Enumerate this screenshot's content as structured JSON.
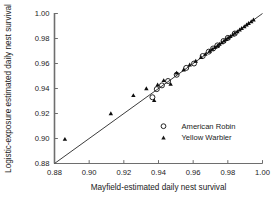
{
  "chart_data": {
    "type": "scatter",
    "title": "",
    "xlabel": "Mayfield-estimated daily nest survival",
    "ylabel": "Logistic-exposure estimated daily nest survival",
    "xlim": [
      0.88,
      1.0
    ],
    "ylim": [
      0.88,
      1.0
    ],
    "xticks": [
      "0.88",
      "0.90",
      "0.92",
      "0.94",
      "0.96",
      "0.98",
      "1.00"
    ],
    "yticks": [
      "0.88",
      "0.90",
      "0.92",
      "0.94",
      "0.96",
      "0.98",
      "1.00"
    ],
    "xtick_values": [
      0.88,
      0.9,
      0.92,
      0.94,
      0.96,
      0.98,
      1.0
    ],
    "ytick_values": [
      0.88,
      0.9,
      0.92,
      0.94,
      0.96,
      0.98,
      1.0
    ],
    "grid": false,
    "legend_position": "inside-lower-right",
    "reference_line": {
      "label": "1:1 line",
      "from": [
        0.88,
        0.88
      ],
      "to": [
        1.0,
        1.0
      ],
      "color": "#3c3c3c"
    },
    "series": [
      {
        "name": "American Robin",
        "marker": "open-circle",
        "color": "#1a1a1a",
        "points": [
          [
            0.9365,
            0.933
          ],
          [
            0.939,
            0.9395
          ],
          [
            0.942,
            0.9425
          ],
          [
            0.9455,
            0.946
          ],
          [
            0.9505,
            0.951
          ],
          [
            0.956,
            0.9565
          ],
          [
            0.9605,
            0.96
          ],
          [
            0.9655,
            0.966
          ],
          [
            0.969,
            0.9695
          ],
          [
            0.9715,
            0.972
          ],
          [
            0.974,
            0.9745
          ],
          [
            0.9775,
            0.978
          ],
          [
            0.98,
            0.9805
          ],
          [
            0.984,
            0.984
          ]
        ]
      },
      {
        "name": "Yellow Warbler",
        "marker": "filled-triangle",
        "color": "#0d0d0d",
        "points": [
          [
            0.886,
            0.8995
          ],
          [
            0.9125,
            0.92
          ],
          [
            0.9255,
            0.9345
          ],
          [
            0.933,
            0.94
          ],
          [
            0.9375,
            0.9305
          ],
          [
            0.9395,
            0.943
          ],
          [
            0.943,
            0.9465
          ],
          [
            0.947,
            0.9435
          ],
          [
            0.9505,
            0.9525
          ],
          [
            0.9545,
            0.955
          ],
          [
            0.958,
            0.959
          ],
          [
            0.9615,
            0.962
          ],
          [
            0.9645,
            0.965
          ],
          [
            0.967,
            0.9675
          ],
          [
            0.9695,
            0.97
          ],
          [
            0.971,
            0.9715
          ],
          [
            0.9725,
            0.973
          ],
          [
            0.974,
            0.9742
          ],
          [
            0.9752,
            0.9756
          ],
          [
            0.9765,
            0.9768
          ],
          [
            0.9778,
            0.9782
          ],
          [
            0.979,
            0.9794
          ],
          [
            0.9802,
            0.9806
          ],
          [
            0.9815,
            0.9818
          ],
          [
            0.9828,
            0.983
          ],
          [
            0.984,
            0.9843
          ],
          [
            0.9855,
            0.9856
          ],
          [
            0.9868,
            0.987
          ],
          [
            0.988,
            0.9882
          ],
          [
            0.9895,
            0.9896
          ],
          [
            0.9908,
            0.991
          ],
          [
            0.992,
            0.9922
          ],
          [
            0.9935,
            0.9936
          ],
          [
            0.9948,
            0.995
          ]
        ]
      }
    ],
    "legend": [
      {
        "label": "American Robin",
        "marker": "open-circle"
      },
      {
        "label": "Yellow Warbler",
        "marker": "filled-triangle"
      }
    ]
  }
}
